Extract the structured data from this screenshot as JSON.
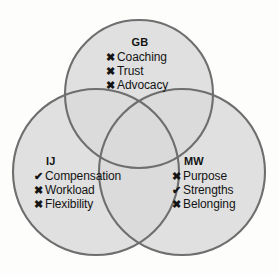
{
  "diagram": {
    "type": "venn-3-circle",
    "background_color": "#fdfdfc",
    "circle_fill": "#d9d9d9",
    "circle_stroke": "#6e6e6e",
    "overlap_fill": "#bdbdbd",
    "triple_overlap_fill": "#ababab",
    "text_color": "#141414"
  },
  "groups": [
    {
      "id": "gb",
      "title": "GB",
      "items": [
        {
          "marker": "cross-icon",
          "marker_glyph": "✖",
          "label": "Coaching"
        },
        {
          "marker": "cross-icon",
          "marker_glyph": "✖",
          "label": "Trust"
        },
        {
          "marker": "cross-icon",
          "marker_glyph": "✖",
          "label": "Advocacy"
        }
      ]
    },
    {
      "id": "ij",
      "title": "IJ",
      "items": [
        {
          "marker": "check-icon",
          "marker_glyph": "✔",
          "label": "Compensation"
        },
        {
          "marker": "cross-icon",
          "marker_glyph": "✖",
          "label": "Workload"
        },
        {
          "marker": "cross-icon",
          "marker_glyph": "✖",
          "label": "Flexibility"
        }
      ]
    },
    {
      "id": "mw",
      "title": "MW",
      "items": [
        {
          "marker": "cross-icon",
          "marker_glyph": "✖",
          "label": "Purpose"
        },
        {
          "marker": "check-icon",
          "marker_glyph": "✔",
          "label": "Strengths"
        },
        {
          "marker": "cross-icon",
          "marker_glyph": "✖",
          "label": "Belonging"
        }
      ]
    }
  ]
}
